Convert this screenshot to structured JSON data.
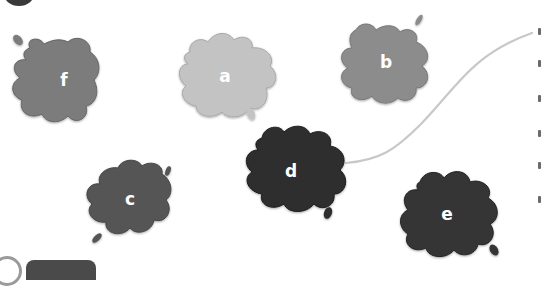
{
  "page": {
    "type": "workbook exercise",
    "background": "#ffffff"
  },
  "splats": [
    {
      "id": "f",
      "label": "f",
      "color": "#7b7b7b",
      "cx": 60,
      "cy": 80
    },
    {
      "id": "a",
      "label": "a",
      "color": "#c3c3c3",
      "cx": 224,
      "cy": 76
    },
    {
      "id": "b",
      "label": "b",
      "color": "#8c8c8c",
      "cx": 385,
      "cy": 62
    },
    {
      "id": "d",
      "label": "d",
      "color": "#2e2e2e",
      "cx": 290,
      "cy": 171
    },
    {
      "id": "c",
      "label": "c",
      "color": "#555555",
      "cx": 130,
      "cy": 199
    },
    {
      "id": "e",
      "label": "e",
      "color": "#353535",
      "cx": 447,
      "cy": 214
    }
  ],
  "connector": {
    "from": "d",
    "to": "right-margin-item-1",
    "color": "#c8c8c8"
  },
  "labels": {
    "f": "f",
    "a": "a",
    "b": "b",
    "c": "c",
    "d": "d",
    "e": "e"
  }
}
